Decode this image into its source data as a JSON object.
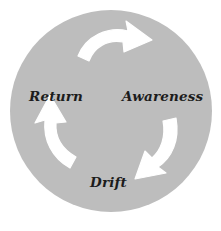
{
  "diagram": {
    "type": "cycle",
    "direction": "clockwise",
    "background_color": "#ffffff",
    "circle": {
      "fill_color": "#bdbdbd",
      "center_x": 111,
      "center_y": 111,
      "radius": 101
    },
    "arrow_color": "#ffffff",
    "label_color": "#1c1c1c",
    "stages": [
      {
        "id": "awareness",
        "label": "Awareness",
        "position": "right",
        "order": 1
      },
      {
        "id": "drift",
        "label": "Drift",
        "position": "bottom",
        "order": 2
      },
      {
        "id": "return",
        "label": "Return",
        "position": "left",
        "order": 3
      }
    ],
    "arrows": [
      {
        "id": "arrow-top",
        "from": "return",
        "to": "awareness",
        "position": "top",
        "points": "right"
      },
      {
        "id": "arrow-right",
        "from": "awareness",
        "to": "drift",
        "position": "right",
        "points": "down-left"
      },
      {
        "id": "arrow-left",
        "from": "drift",
        "to": "return",
        "position": "left",
        "points": "up-left"
      }
    ]
  }
}
